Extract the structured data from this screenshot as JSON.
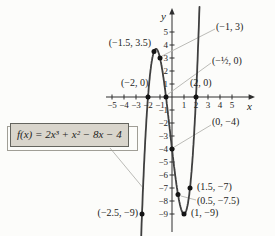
{
  "figure": {
    "equation_label": "f(x) = 2x³ + x² − 8x − 4",
    "axis_x_label": "x",
    "axis_y_label": "y"
  },
  "chart_data": {
    "type": "line",
    "xlabel": "x",
    "ylabel": "y",
    "function": {
      "expression": "2x^3 + x^2 - 8x - 4",
      "coefficients": [
        2,
        1,
        -8,
        -4
      ]
    },
    "x_sample_range": [
      -2.57,
      2.29
    ],
    "xlim": [
      -5.8,
      6.5
    ],
    "ylim": [
      -10.8,
      6.8
    ],
    "grid": false,
    "x_ticks": [
      -5,
      -4,
      -3,
      -2,
      -1,
      1,
      2,
      3,
      4,
      5
    ],
    "y_ticks": [
      5,
      4,
      3,
      2,
      1,
      -1,
      -2,
      -3,
      -4,
      -5,
      -6,
      -7,
      -8,
      -9
    ],
    "points": [
      [
        -2.5,
        -9
      ],
      [
        -2,
        0
      ],
      [
        -1.5,
        3.5
      ],
      [
        -1,
        3
      ],
      [
        -0.5,
        0
      ],
      [
        0,
        -4
      ],
      [
        0.5,
        -7.5
      ],
      [
        1,
        -9
      ],
      [
        1.5,
        -7
      ],
      [
        2,
        0
      ]
    ],
    "point_labels": [
      {
        "text": "(−1.5, 3.5)",
        "x": 151,
        "y": 37,
        "anchor": "end"
      },
      {
        "text": "(−1, 3)",
        "x": 216,
        "y": 21,
        "anchor": "start"
      },
      {
        "text": "(−½, 0)",
        "x": 212,
        "y": 55,
        "anchor": "start"
      },
      {
        "text": "(−2, 0)",
        "x": 121,
        "y": 77,
        "anchor": "start"
      },
      {
        "text": "(2, 0)",
        "x": 190,
        "y": 77,
        "anchor": "start"
      },
      {
        "text": "(0, −4)",
        "x": 212,
        "y": 116,
        "anchor": "start"
      },
      {
        "text": "(1.5, −7)",
        "x": 197,
        "y": 181,
        "anchor": "start"
      },
      {
        "text": "(0.5, −7.5)",
        "x": 197,
        "y": 195,
        "anchor": "start"
      },
      {
        "text": "(1, −9)",
        "x": 191,
        "y": 207,
        "anchor": "start"
      },
      {
        "text": "(−2.5, −9)",
        "x": 138,
        "y": 207,
        "anchor": "end"
      }
    ],
    "leader_lines": [
      {
        "x1": 215,
        "y1": 29,
        "x2": 162,
        "y2": 56
      },
      {
        "x1": 211,
        "y1": 63,
        "x2": 167.5,
        "y2": 94.5
      },
      {
        "x1": 211,
        "y1": 125,
        "x2": 173.5,
        "y2": 147.5
      },
      {
        "x1": 196,
        "y1": 200,
        "x2": 181,
        "y2": 196
      },
      {
        "x1": 110,
        "y1": 148,
        "x2": 144,
        "y2": 189
      }
    ],
    "axes": {
      "origin_px": [
        172,
        97
      ],
      "unit_px": [
        12,
        13
      ]
    },
    "style": {
      "curve_color": "#3f3f3f",
      "axis_color": "#2e2e2e",
      "point_color": "#141414",
      "leader_color": "#b3b3af",
      "equation_box_fill": "#d9d5cc",
      "equation_box_border": "#64645e"
    }
  }
}
